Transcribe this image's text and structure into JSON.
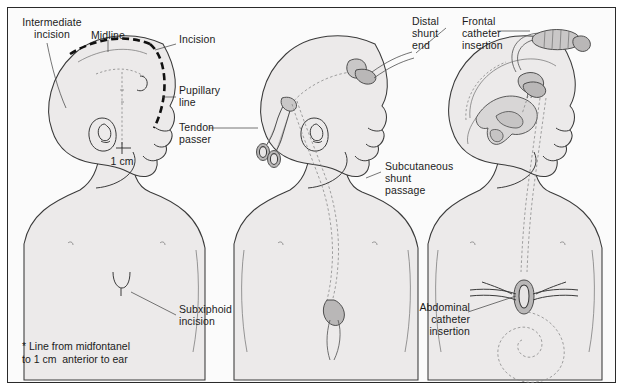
{
  "figure": {
    "frame_border_color": "#2a2a2a",
    "background_color": "#fbfbfb"
  },
  "panels": [
    {
      "id": "panel-left",
      "name": "incision-planning",
      "labels": [
        {
          "id": "intermediate-incision",
          "text": "Intermediate\nincision"
        },
        {
          "id": "midline",
          "text": "Midline"
        },
        {
          "id": "incision",
          "text": "Incision"
        },
        {
          "id": "pupillary-line",
          "text": "Pupillary\nline"
        },
        {
          "id": "measurement",
          "text": "1 cm"
        },
        {
          "id": "subxiphoid-incision",
          "text": "Subxiphoid\nincision"
        }
      ]
    },
    {
      "id": "panel-middle",
      "name": "shunt-tunneling",
      "labels": [
        {
          "id": "tendon-passer",
          "text": "Tendon\npasser"
        },
        {
          "id": "distal-shunt-end",
          "text": "Distal\nshunt\nend"
        },
        {
          "id": "subcutaneous-shunt-passage",
          "text": "Subcutaneous\nshunt\npassage"
        }
      ]
    },
    {
      "id": "panel-right",
      "name": "catheter-insertion",
      "labels": [
        {
          "id": "frontal-catheter-insertion",
          "text": "Frontal\ncatheter\ninsertion"
        },
        {
          "id": "abdominal-catheter-insertion",
          "text": "Abdominal\ncatheter\ninsertion"
        }
      ]
    }
  ],
  "footnote": {
    "line1": "* Line from midfontanel",
    "line2": "to 1 cm  anterior to ear"
  }
}
